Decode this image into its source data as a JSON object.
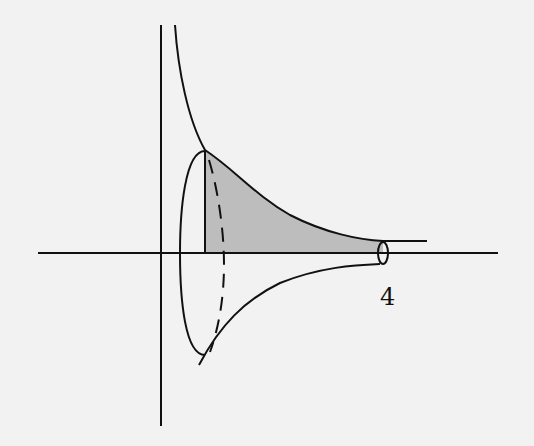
{
  "figure": {
    "labels": {
      "x_tick": "4"
    },
    "colors": {
      "background": "#f2f2f2",
      "stroke": "#111111",
      "shaded_region": "#bdbdbd"
    }
  }
}
